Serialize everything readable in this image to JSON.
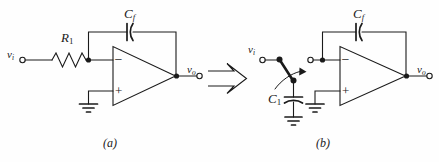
{
  "figure": {
    "background_color": "#fefefe",
    "stroke_color": "#1a1a1a",
    "text_color": "#1a1a1a",
    "width": 439,
    "height": 162
  },
  "circuit_a": {
    "caption": "(a)",
    "input_terminal_label": "v",
    "input_terminal_sub": "i",
    "output_terminal_label": "v",
    "output_terminal_sub": "o",
    "resistor_label": "R",
    "resistor_sub": "1",
    "feedback_cap_label": "C",
    "feedback_cap_sub": "f",
    "opamp_minus": "−",
    "opamp_plus": "+",
    "ground_name": "ground-symbol"
  },
  "circuit_b": {
    "caption": "(b)",
    "input_terminal_label": "v",
    "input_terminal_sub": "i",
    "output_terminal_label": "v",
    "output_terminal_sub": "o",
    "switch_cap_label": "C",
    "switch_cap_sub": "1",
    "feedback_cap_label": "C",
    "feedback_cap_sub": "f",
    "opamp_minus": "−",
    "opamp_plus": "+",
    "ground_name": "ground-symbol"
  },
  "transform_arrow": {
    "name": "equivalence-arrow",
    "direction": "right"
  }
}
